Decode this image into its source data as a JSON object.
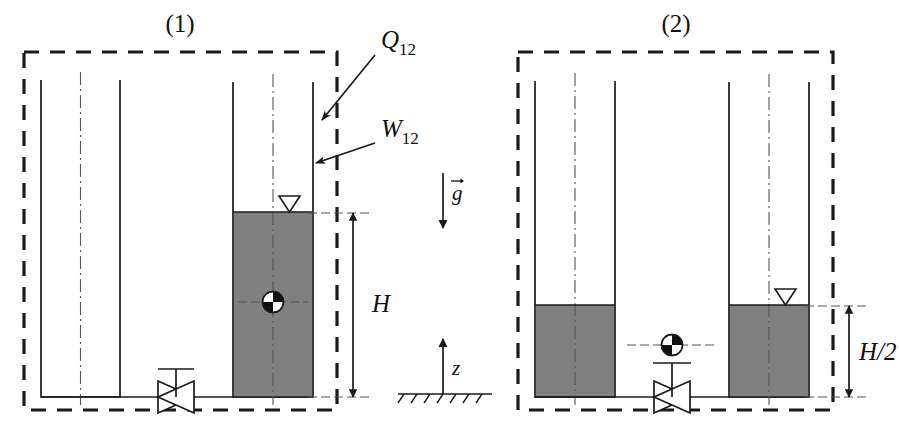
{
  "figure": {
    "type": "engineering-schematic",
    "background_color": "#ffffff",
    "line_color": "#1a1a1a",
    "liquid_fill_color": "#808080"
  },
  "panels": [
    {
      "id": "panel-1",
      "label": "(1)",
      "boundary": {
        "x": 24,
        "y": 52,
        "width": 313,
        "height": 358
      },
      "tanks": [
        {
          "id": "tank-1-left",
          "name": "left-tank",
          "x": 41,
          "y": 80,
          "width": 79,
          "height": 317,
          "fill_level_y": 397,
          "fill_state": "empty",
          "has_surface_marker": false
        },
        {
          "id": "tank-1-right",
          "name": "right-tank",
          "x": 233,
          "y": 82,
          "width": 80,
          "height": 315,
          "fill_level_y": 212,
          "fill_state": "full",
          "has_surface_marker": true
        }
      ],
      "valve": {
        "x": 176,
        "y": 397,
        "state": "closed"
      },
      "center_of_mass": {
        "x": 273,
        "y": 302
      },
      "dimension": {
        "name": "height-dimension",
        "label": "H",
        "x": 353,
        "y_top": 213,
        "y_bottom": 397
      }
    },
    {
      "id": "panel-2",
      "label": "(2)",
      "boundary": {
        "x": 518,
        "y": 52,
        "width": 315,
        "height": 358
      },
      "tanks": [
        {
          "id": "tank-2-left",
          "name": "left-tank",
          "x": 535,
          "y": 81,
          "width": 80,
          "height": 316,
          "fill_level_y": 305,
          "fill_state": "half",
          "has_surface_marker": false
        },
        {
          "id": "tank-2-right",
          "name": "right-tank",
          "x": 729,
          "y": 82,
          "width": 80,
          "height": 315,
          "fill_level_y": 305,
          "fill_state": "half",
          "has_surface_marker": true
        }
      ],
      "valve": {
        "x": 672,
        "y": 397,
        "state": "open"
      },
      "center_of_mass": {
        "x": 672,
        "y": 345
      },
      "dimension": {
        "name": "half-height-dimension",
        "label": "H/2",
        "x": 849,
        "y_top": 306,
        "y_bottom": 397
      }
    }
  ],
  "energy_transfers": [
    {
      "id": "heat-transfer",
      "symbol": "Q",
      "subscript": "12",
      "label": "Q12",
      "label_x": 381,
      "label_y": 48,
      "arrow": {
        "x1": 375,
        "y1": 55,
        "x2": 322,
        "y2": 120
      }
    },
    {
      "id": "work-transfer",
      "symbol": "W",
      "subscript": "12",
      "label": "W12",
      "label_x": 381,
      "label_y": 137,
      "arrow": {
        "x1": 375,
        "y1": 143,
        "x2": 316,
        "y2": 163
      }
    }
  ],
  "reference_axes": {
    "gravity": {
      "id": "gravity-vector",
      "label": "g",
      "label_x": 455,
      "label_y": 201,
      "arrow": {
        "x": 443,
        "y1": 173,
        "y2": 228
      },
      "direction": "down"
    },
    "vertical_axis": {
      "id": "z-axis",
      "label": "z",
      "label_x": 455,
      "label_y": 372,
      "arrow": {
        "x": 443,
        "y1": 394,
        "y2": 339
      },
      "direction": "up"
    },
    "ground": {
      "id": "ground-line",
      "x1": 398,
      "x2": 492,
      "y": 394,
      "hatch_count": 7
    }
  }
}
